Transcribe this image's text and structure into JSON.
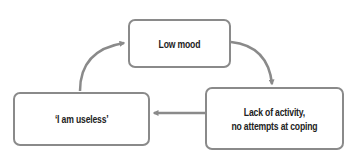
{
  "diagram": {
    "type": "cycle",
    "nodes": [
      {
        "id": "top",
        "label": "Low mood"
      },
      {
        "id": "right",
        "label": "Lack of activity,\nno attempts at coping"
      },
      {
        "id": "left",
        "label": "‘I am useless’"
      }
    ],
    "edges": [
      {
        "from": "top",
        "to": "right"
      },
      {
        "from": "right",
        "to": "left"
      },
      {
        "from": "left",
        "to": "top"
      }
    ],
    "colors": {
      "border": "#8a8a8a",
      "arrow": "#8a8a8a",
      "text": "#222222",
      "background": "#ffffff"
    }
  }
}
